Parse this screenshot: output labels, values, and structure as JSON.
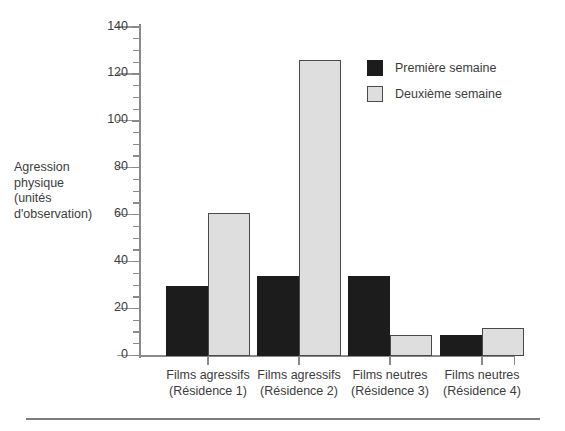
{
  "chart_data": {
    "type": "bar",
    "title": "",
    "xlabel": "",
    "ylabel": "Agression physique (unités d'observation)",
    "ylim": [
      0,
      140
    ],
    "ytick_step": 20,
    "yminor_step": 5,
    "grid": false,
    "legend_position": "top-right",
    "categories": [
      "Films agressifs\n(Résidence 1)",
      "Films agressifs\n(Résidence 2)",
      "Films neutres\n(Résidence 3)",
      "Films neutres\n(Résidence 4)"
    ],
    "ytick_labels": [
      "0",
      "20",
      "40",
      "60",
      "80",
      "100",
      "120",
      "140"
    ],
    "ytick_values": [
      0,
      20,
      40,
      60,
      80,
      100,
      120,
      140
    ],
    "series": [
      {
        "name": "Première semaine",
        "color": "#1c1c1c",
        "values": [
          30,
          34,
          34,
          9
        ]
      },
      {
        "name": "Deuxième semaine",
        "color": "#dedede",
        "values": [
          61,
          126,
          9,
          12
        ]
      }
    ]
  },
  "axis": {
    "y_title_text": "Agression\nphysique\n(unités\nd'observation)"
  },
  "legend": {
    "entries": [
      {
        "label": "Première semaine",
        "swatch": "dark-square-swatch"
      },
      {
        "label": "Deuxième semaine",
        "swatch": "light-square-swatch"
      }
    ]
  }
}
